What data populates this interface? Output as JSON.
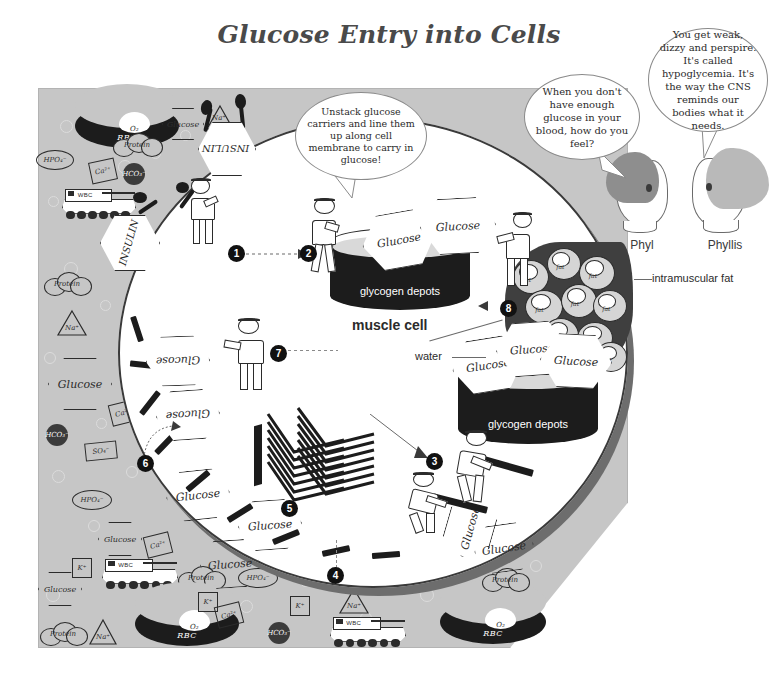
{
  "title": "Glucose Entry into Cells",
  "speech": {
    "question": "When you don't have enough glucose in your blood, how do you feel?",
    "answer": "You get weak, dizzy and perspire. It's called hypoglycemia. It's the way the CNS reminds our bodies what it needs.",
    "instruction": "Unstack glucose carriers and line them up along cell membrane to carry in glucose!"
  },
  "characters": [
    {
      "name": "Phyl"
    },
    {
      "name": "Phyllis"
    }
  ],
  "labels": {
    "muscle_cell": "muscle cell",
    "glycogen_depots_1": "glycogen depots",
    "glycogen_depots_2": "glycogen depots",
    "water": "water",
    "intramuscular_fat": "intramuscular fat"
  },
  "steps": [
    "1",
    "2",
    "3",
    "4",
    "5",
    "6",
    "7",
    "8"
  ],
  "molecules": {
    "glucose": "Glucose",
    "insulin": "INSULIN",
    "rbc": "RBC",
    "wbc": "WBC",
    "protein": "Protein",
    "oxygen": "O₂",
    "phosphate": "HPO₄⁻",
    "bicarbonate": "HCO₃⁻",
    "calcium": "Ca²⁺",
    "sodium": "Na⁺",
    "potassium": "K⁺",
    "sulfate": "SO₄⁻",
    "fat": "fat"
  },
  "colors": {
    "plasma": "#c6c6c6",
    "cell": "#ffffff",
    "depot": "#1c1c1c",
    "fat_bg": "#3f3f3f",
    "fat_glob": "#d5d5d5",
    "ink": "#2b2b2b",
    "title": "#4a4a4a"
  }
}
